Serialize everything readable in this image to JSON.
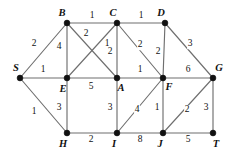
{
  "figure": {
    "name": "weighted-undirected-graph",
    "width": 233,
    "height": 158,
    "background_color": "#ffffff",
    "edge_color": "#6f6f6f",
    "node_color": "#111111",
    "label_color": "#111111"
  },
  "chart_data": {
    "type": "diagram",
    "title": "",
    "xlabel": "",
    "ylabel": "",
    "graph_kind": "weighted undirected graph",
    "node_count": 12,
    "edge_count": 23,
    "nodes": [
      {
        "id": "S",
        "label": "S",
        "x": 20,
        "y": 78,
        "label_x": 16,
        "label_y": 68
      },
      {
        "id": "B",
        "label": "B",
        "x": 67,
        "y": 23,
        "label_x": 62,
        "label_y": 13
      },
      {
        "id": "C",
        "label": "C",
        "x": 117,
        "y": 23,
        "label_x": 113,
        "label_y": 13
      },
      {
        "id": "D",
        "label": "D",
        "x": 165,
        "y": 23,
        "label_x": 161,
        "label_y": 13
      },
      {
        "id": "E",
        "label": "E",
        "x": 67,
        "y": 78,
        "label_x": 63,
        "label_y": 89
      },
      {
        "id": "A",
        "label": "A",
        "x": 117,
        "y": 78,
        "label_x": 121,
        "label_y": 88
      },
      {
        "id": "F",
        "label": "F",
        "x": 163,
        "y": 78,
        "label_x": 169,
        "label_y": 87
      },
      {
        "id": "G",
        "label": "G",
        "x": 213,
        "y": 78,
        "label_x": 219,
        "label_y": 68
      },
      {
        "id": "H",
        "label": "H",
        "x": 67,
        "y": 133,
        "label_x": 63,
        "label_y": 144
      },
      {
        "id": "I",
        "label": "I",
        "x": 117,
        "y": 133,
        "label_x": 114,
        "label_y": 144
      },
      {
        "id": "J",
        "label": "J",
        "x": 163,
        "y": 133,
        "label_x": 160,
        "label_y": 144
      },
      {
        "id": "T",
        "label": "T",
        "x": 213,
        "y": 133,
        "label_x": 216,
        "label_y": 144
      }
    ],
    "edges": [
      {
        "source": "S",
        "target": "B",
        "weight": 2,
        "label_x": 34,
        "label_y": 44
      },
      {
        "source": "S",
        "target": "E",
        "weight": 1,
        "label_x": 43,
        "label_y": 70
      },
      {
        "source": "S",
        "target": "H",
        "weight": 1,
        "label_x": 34,
        "label_y": 112
      },
      {
        "source": "B",
        "target": "C",
        "weight": 1,
        "label_x": 92,
        "label_y": 16
      },
      {
        "source": "C",
        "target": "D",
        "weight": 1,
        "label_x": 141,
        "label_y": 16
      },
      {
        "source": "B",
        "target": "E",
        "weight": 4,
        "label_x": 59,
        "label_y": 47
      },
      {
        "source": "B",
        "target": "A",
        "weight": 2,
        "label_x": 86,
        "label_y": 34
      },
      {
        "source": "C",
        "target": "E",
        "weight": 1,
        "label_x": 107,
        "label_y": 44
      },
      {
        "source": "C",
        "target": "A",
        "weight": 2,
        "label_x": 110,
        "label_y": 52
      },
      {
        "source": "C",
        "target": "F",
        "weight": 2,
        "label_x": 140,
        "label_y": 45
      },
      {
        "source": "D",
        "target": "F",
        "weight": 2,
        "label_x": 158,
        "label_y": 52
      },
      {
        "source": "D",
        "target": "G",
        "weight": 3,
        "label_x": 190,
        "label_y": 44
      },
      {
        "source": "E",
        "target": "A",
        "weight": 5,
        "label_x": 91,
        "label_y": 87
      },
      {
        "source": "A",
        "target": "F",
        "weight": 1,
        "label_x": 140,
        "label_y": 70
      },
      {
        "source": "F",
        "target": "G",
        "weight": 6,
        "label_x": 188,
        "label_y": 70
      },
      {
        "source": "E",
        "target": "H",
        "weight": 3,
        "label_x": 59,
        "label_y": 108
      },
      {
        "source": "A",
        "target": "I",
        "weight": 3,
        "label_x": 110,
        "label_y": 108
      },
      {
        "source": "I",
        "target": "F",
        "weight": 4,
        "label_x": 137,
        "label_y": 110
      },
      {
        "source": "F",
        "target": "J",
        "weight": 1,
        "label_x": 157,
        "label_y": 108
      },
      {
        "source": "J",
        "target": "G",
        "weight": 2,
        "label_x": 187,
        "label_y": 110
      },
      {
        "source": "G",
        "target": "T",
        "weight": 3,
        "label_x": 206,
        "label_y": 108
      },
      {
        "source": "H",
        "target": "I",
        "weight": 2,
        "label_x": 91,
        "label_y": 140
      },
      {
        "source": "I",
        "target": "J",
        "weight": 8,
        "label_x": 140,
        "label_y": 140
      },
      {
        "source": "J",
        "target": "T",
        "weight": 5,
        "label_x": 188,
        "label_y": 140
      }
    ]
  }
}
